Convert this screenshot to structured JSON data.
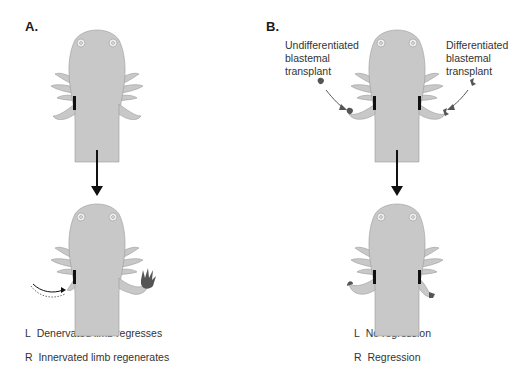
{
  "panels": [
    {
      "label": "A.",
      "captions": [
        {
          "side": "L",
          "text": "Denervated limb regresses"
        },
        {
          "side": "R",
          "text": "Innervated limb regenerates"
        }
      ]
    },
    {
      "label": "B.",
      "callouts": [
        {
          "text_lines": [
            "Undifferentiated",
            "blastemal",
            "transplant"
          ]
        },
        {
          "text_lines": [
            "Differentiated",
            "blastemal",
            "transplant"
          ]
        }
      ],
      "captions": [
        {
          "side": "L",
          "text": "No regression"
        },
        {
          "side": "R",
          "text": "Regression"
        }
      ]
    }
  ],
  "colors": {
    "body": "#c8c8c8",
    "outline": "#8a8a8a",
    "nerve_cut": "#111111",
    "blastema": "#555555",
    "arrow": "#111111"
  }
}
